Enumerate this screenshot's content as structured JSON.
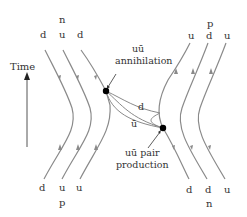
{
  "diagram": {
    "time_label": "Time",
    "top_left": {
      "particle": "n",
      "quarks": [
        "d",
        "u",
        "d"
      ]
    },
    "top_right": {
      "particle": "p",
      "quarks": [
        "u",
        "d",
        "u"
      ]
    },
    "bottom_left": {
      "particle": "p",
      "quarks": [
        "d",
        "u",
        "u"
      ]
    },
    "bottom_right": {
      "particle": "n",
      "quarks": [
        "d",
        "d",
        "u"
      ]
    },
    "annihilation_label_1": "uū",
    "annihilation_label_2": "annihilation",
    "exchange_quark_d": "d",
    "exchange_quark_ubar": "ū",
    "pair_label_1": "uū pair",
    "pair_label_2": "production",
    "colors": {
      "line": "#8a8a8a",
      "vertex": "#000000",
      "text": "#333333"
    }
  }
}
